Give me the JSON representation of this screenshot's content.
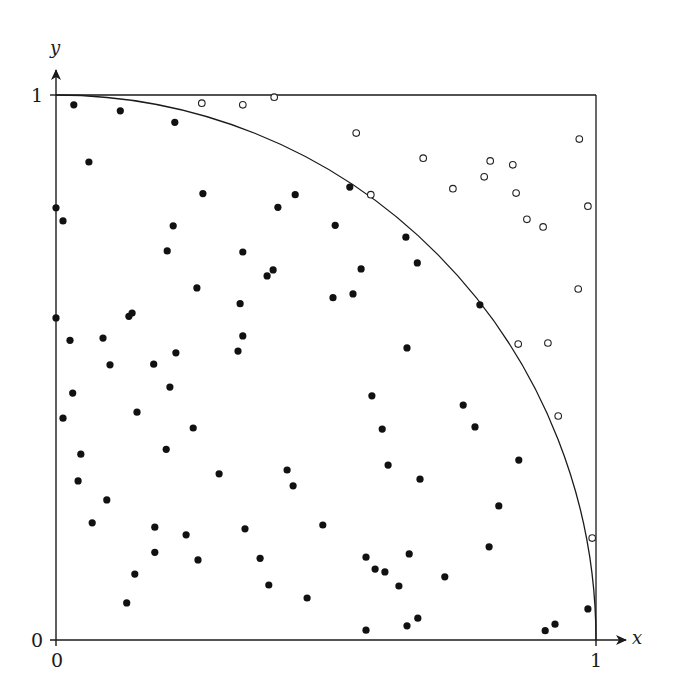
{
  "chart_data": {
    "type": "scatter",
    "title": "",
    "xlabel": "x",
    "ylabel": "y",
    "xlim": [
      0,
      1
    ],
    "ylim": [
      0,
      1
    ],
    "x_ticks": [
      "0",
      "1"
    ],
    "y_ticks": [
      "0",
      "1"
    ],
    "grid": false,
    "legend": null,
    "annotations": {
      "unit_square": true,
      "quarter_circle": "x^2 + y^2 = 1 arc from (0,1) to (1,0)"
    },
    "series": [
      {
        "name": "inside",
        "marker": "filled-circle",
        "color": "#111111",
        "points": [
          [
            0.033,
            0.982
          ],
          [
            0.119,
            0.971
          ],
          [
            0.22,
            0.95
          ],
          [
            0.061,
            0.877
          ],
          [
            0.272,
            0.819
          ],
          [
            0.443,
            0.817
          ],
          [
            0.544,
            0.831
          ],
          [
            0.411,
            0.794
          ],
          [
            0.0,
            0.793
          ],
          [
            0.013,
            0.769
          ],
          [
            0.217,
            0.76
          ],
          [
            0.517,
            0.761
          ],
          [
            0.648,
            0.739
          ],
          [
            0.206,
            0.714
          ],
          [
            0.346,
            0.712
          ],
          [
            0.669,
            0.692
          ],
          [
            0.565,
            0.681
          ],
          [
            0.402,
            0.679
          ],
          [
            0.391,
            0.668
          ],
          [
            0.261,
            0.646
          ],
          [
            0.55,
            0.635
          ],
          [
            0.513,
            0.628
          ],
          [
            0.341,
            0.617
          ],
          [
            0.785,
            0.615
          ],
          [
            0.135,
            0.594
          ],
          [
            0.141,
            0.6
          ],
          [
            0.0,
            0.591
          ],
          [
            0.026,
            0.55
          ],
          [
            0.087,
            0.554
          ],
          [
            0.346,
            0.558
          ],
          [
            0.65,
            0.536
          ],
          [
            0.337,
            0.53
          ],
          [
            0.222,
            0.527
          ],
          [
            0.1,
            0.505
          ],
          [
            0.181,
            0.506
          ],
          [
            0.211,
            0.464
          ],
          [
            0.031,
            0.453
          ],
          [
            0.585,
            0.448
          ],
          [
            0.754,
            0.431
          ],
          [
            0.15,
            0.418
          ],
          [
            0.013,
            0.407
          ],
          [
            0.604,
            0.387
          ],
          [
            0.776,
            0.391
          ],
          [
            0.254,
            0.389
          ],
          [
            0.204,
            0.35
          ],
          [
            0.046,
            0.341
          ],
          [
            0.615,
            0.321
          ],
          [
            0.857,
            0.33
          ],
          [
            0.428,
            0.312
          ],
          [
            0.302,
            0.305
          ],
          [
            0.674,
            0.295
          ],
          [
            0.041,
            0.292
          ],
          [
            0.439,
            0.283
          ],
          [
            0.094,
            0.257
          ],
          [
            0.82,
            0.246
          ],
          [
            0.067,
            0.215
          ],
          [
            0.494,
            0.211
          ],
          [
            0.183,
            0.207
          ],
          [
            0.35,
            0.204
          ],
          [
            0.241,
            0.193
          ],
          [
            0.802,
            0.171
          ],
          [
            0.183,
            0.161
          ],
          [
            0.654,
            0.158
          ],
          [
            0.574,
            0.152
          ],
          [
            0.378,
            0.15
          ],
          [
            0.263,
            0.147
          ],
          [
            0.591,
            0.13
          ],
          [
            0.609,
            0.125
          ],
          [
            0.146,
            0.121
          ],
          [
            0.72,
            0.116
          ],
          [
            0.394,
            0.101
          ],
          [
            0.635,
            0.099
          ],
          [
            0.465,
            0.077
          ],
          [
            0.131,
            0.068
          ],
          [
            0.985,
            0.057
          ],
          [
            0.67,
            0.04
          ],
          [
            0.65,
            0.026
          ],
          [
            0.924,
            0.029
          ],
          [
            0.574,
            0.018
          ],
          [
            0.906,
            0.017
          ]
        ]
      },
      {
        "name": "outside",
        "marker": "open-circle",
        "color": "#222222",
        "points": [
          [
            0.27,
            0.985
          ],
          [
            0.346,
            0.982
          ],
          [
            0.404,
            0.996
          ],
          [
            0.556,
            0.93
          ],
          [
            0.969,
            0.919
          ],
          [
            0.68,
            0.884
          ],
          [
            0.804,
            0.879
          ],
          [
            0.846,
            0.872
          ],
          [
            0.793,
            0.85
          ],
          [
            0.735,
            0.828
          ],
          [
            0.852,
            0.82
          ],
          [
            0.583,
            0.817
          ],
          [
            0.985,
            0.796
          ],
          [
            0.872,
            0.772
          ],
          [
            0.902,
            0.758
          ],
          [
            0.967,
            0.644
          ],
          [
            0.856,
            0.543
          ],
          [
            0.911,
            0.545
          ],
          [
            0.93,
            0.411
          ],
          [
            0.993,
            0.187
          ]
        ]
      }
    ]
  },
  "labels": {
    "x_axis": "x",
    "y_axis": "y",
    "x_tick_0": "0",
    "x_tick_1": "1",
    "y_tick_0": "0",
    "y_tick_1": "1"
  }
}
